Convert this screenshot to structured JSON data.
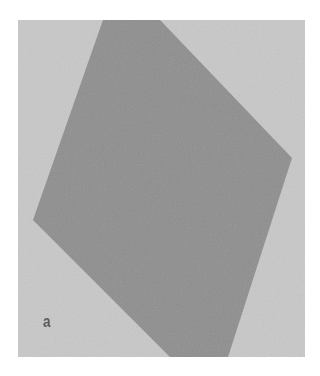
{
  "figure": {
    "panel_label": "a",
    "colors": {
      "background": "#c9c9c9",
      "specimen": "#8f8f8f",
      "page": "#ffffff"
    }
  }
}
